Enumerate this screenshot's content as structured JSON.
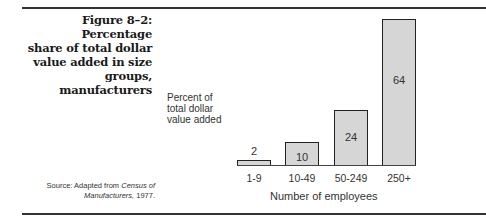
{
  "figure": {
    "title": "Figure 8–2: Percentage share of total dollar value added in size groups, manufacturers",
    "title_lines": [
      "Figure 8–2: Percentage",
      "share of total dollar",
      "value added in size",
      "groups, manufacturers"
    ],
    "source_prefix": "Source: Adapted from ",
    "source_italic1": "Census of",
    "source_italic2": "Manufacturers,",
    "source_suffix": " 1977."
  },
  "chart_data": {
    "type": "bar",
    "title": "Percentage share of total dollar value added in size groups, manufacturers",
    "categories": [
      "1-9",
      "10-49",
      "50-249",
      "250+"
    ],
    "values": [
      2,
      10,
      24,
      64
    ],
    "xlabel": "Number of employees",
    "ylabel": "Percent of total dollar value added",
    "ylabel_lines": [
      "Percent of",
      "total dollar",
      "value added"
    ],
    "ylim": [
      0,
      64
    ],
    "grid": false,
    "legend": null,
    "bar_fill": "#d6d6d6",
    "bar_stroke": "#222222"
  }
}
